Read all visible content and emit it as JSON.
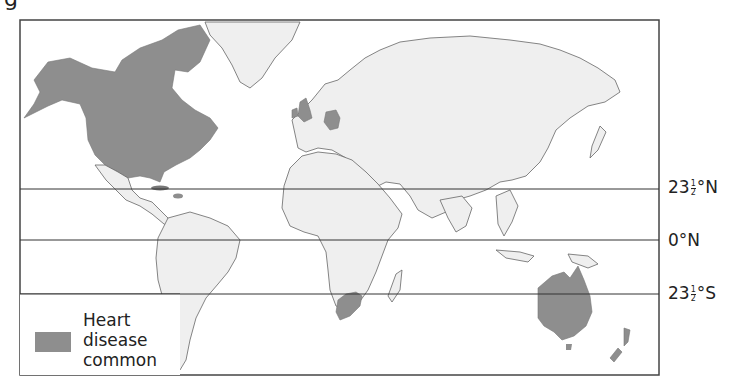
{
  "figure": {
    "label_fragment": "g"
  },
  "map": {
    "type": "world-choropleth",
    "title": "",
    "colors": {
      "land": "#efefef",
      "highlight": "#8e8e8e",
      "border": "#666666",
      "frame": "#444444",
      "latitude_line": "#333333"
    },
    "latitude_lines": [
      {
        "id": "tropic-cancer",
        "label_main": "23",
        "label_num": "1",
        "label_den": "2",
        "label_suffix": "°N"
      },
      {
        "id": "equator",
        "label_main": "0°N"
      },
      {
        "id": "tropic-capricorn",
        "label_main": "23",
        "label_num": "1",
        "label_den": "2",
        "label_suffix": "°S"
      }
    ],
    "highlighted_regions": [
      "Canada",
      "United States",
      "Cuba / Caribbean",
      "United Kingdom",
      "Ireland",
      "Germany",
      "South Africa",
      "Australia",
      "New Zealand"
    ]
  },
  "legend": {
    "line1": "Heart",
    "line2": "disease",
    "line3": "common",
    "swatch_color": "#8e8e8e"
  }
}
